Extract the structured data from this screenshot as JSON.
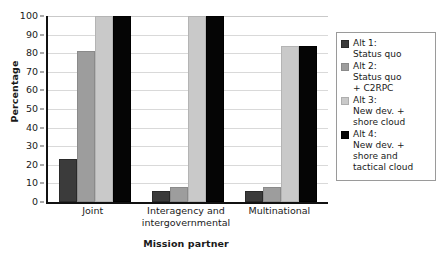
{
  "chart_data": {
    "type": "bar",
    "title": "",
    "xlabel": "Mission partner",
    "ylabel": "Percentage",
    "categories": [
      "Joint",
      "Interagency and intergovernmental",
      "Multinational"
    ],
    "series": [
      {
        "name": "Alt 1: Status quo",
        "values": [
          23,
          6,
          6
        ],
        "color": "#3b3b3b"
      },
      {
        "name": "Alt 2: Status quo + C2RPC",
        "values": [
          81,
          8,
          8
        ],
        "color": "#9d9d9d"
      },
      {
        "name": "Alt 3: New dev. + shore cloud",
        "values": [
          100,
          100,
          84
        ],
        "color": "#c9c9c9"
      },
      {
        "name": "Alt 4: New dev. + shore and tactical cloud",
        "values": [
          100,
          100,
          84
        ],
        "color": "#050505"
      }
    ],
    "ylim": [
      0,
      100
    ],
    "yticks": [
      0,
      10,
      20,
      30,
      40,
      50,
      60,
      70,
      80,
      90,
      100
    ],
    "ytick_labels": [
      "0",
      "10",
      "20",
      "30",
      "40",
      "50",
      "60",
      "70",
      "80",
      "90",
      "100"
    ],
    "grid": true,
    "legend_position": "right",
    "legend_entries": [
      "Alt 1:\nStatus quo",
      "Alt 2:\nStatus quo\n+ C2RPC",
      "Alt 3:\nNew dev. +\nshore cloud",
      "Alt 4:\nNew dev. +\nshore and\ntactical cloud"
    ]
  }
}
